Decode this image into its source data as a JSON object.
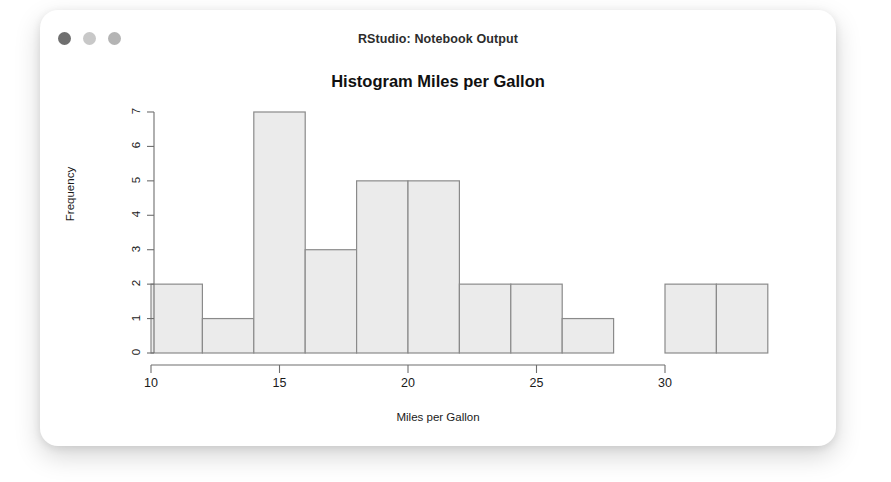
{
  "window": {
    "title": "RStudio: Notebook Output",
    "traffic_lights": [
      {
        "name": "close",
        "color": "#6f6f6f"
      },
      {
        "name": "minimize",
        "color": "#c8c8c8"
      },
      {
        "name": "maximize",
        "color": "#b4b4b4"
      }
    ]
  },
  "chart_data": {
    "type": "bar",
    "title": "Histogram Miles per Gallon",
    "xlabel": "Miles per Gallon",
    "ylabel": "Frequency",
    "bin_width": 2,
    "bin_edges": [
      10,
      12,
      14,
      16,
      18,
      20,
      22,
      24,
      26,
      28,
      30,
      32,
      34
    ],
    "categories": [
      "10-12",
      "12-14",
      "14-16",
      "16-18",
      "18-20",
      "20-22",
      "22-24",
      "24-26",
      "26-28",
      "28-30",
      "30-32",
      "32-34"
    ],
    "values": [
      2,
      1,
      7,
      3,
      5,
      5,
      2,
      2,
      1,
      0,
      2,
      2
    ],
    "xlim": [
      10,
      34
    ],
    "ylim": [
      0,
      7
    ],
    "xticks": [
      10,
      15,
      20,
      25,
      30
    ],
    "yticks": [
      0,
      1,
      2,
      3,
      4,
      5,
      6,
      7
    ],
    "xaxis_line_range": [
      10,
      30
    ],
    "grid": false,
    "legend": null,
    "bar_fill": "#ebebeb",
    "bar_border": "#8a8a8a",
    "axis_color": "#6e6e6e"
  }
}
